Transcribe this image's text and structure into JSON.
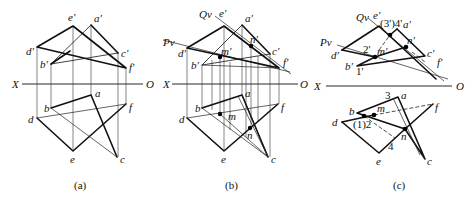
{
  "figure": {
    "panels": [
      {
        "id": "a",
        "caption": "(a)",
        "axis": {
          "left_label": "X",
          "right_label": "O"
        },
        "upper_labels": {
          "e": "e'",
          "a": "a'",
          "d": "d'",
          "c": "c'",
          "b": "b'",
          "f": "f'"
        },
        "lower_labels": {
          "a": "a",
          "b": "b",
          "f": "f",
          "d": "d",
          "e": "e",
          "c": "c"
        }
      },
      {
        "id": "b",
        "caption": "(b)",
        "axis": {
          "left_label": "X",
          "right_label": "O"
        },
        "planes": {
          "q": "Qv",
          "p": "Pv"
        },
        "upper_labels": {
          "e": "e'",
          "a": "a'",
          "d": "d'",
          "c": "c'",
          "b": "b'",
          "f": "f'",
          "m": "m'",
          "n": "n'"
        },
        "lower_labels": {
          "a": "a",
          "b": "b",
          "f": "f",
          "d": "d",
          "e": "e",
          "c": "c",
          "m": "m",
          "n": "n"
        }
      },
      {
        "id": "c",
        "caption": "(c)",
        "axis": {
          "left_label": "X",
          "right_label": "O"
        },
        "planes": {
          "q": "Qv",
          "p": "Pv"
        },
        "upper_labels": {
          "e": "e'",
          "a": "a'",
          "d": "d'",
          "c": "c'",
          "b": "b'",
          "f": "f'",
          "m": "m'",
          "n": "n'",
          "p34": "(3')4'",
          "p2": "2'",
          "p1": "1'"
        },
        "lower_labels": {
          "a": "a",
          "b": "b",
          "f": "f",
          "d": "d",
          "e": "e",
          "c": "c",
          "m": "m",
          "n": "n",
          "p3": "3",
          "p12": "(1)2",
          "p4": "4"
        }
      }
    ]
  }
}
